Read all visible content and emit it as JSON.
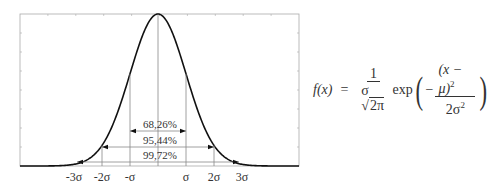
{
  "diagram": {
    "frame": {
      "x0": 20,
      "x1": 299,
      "y0": 14,
      "y1": 166
    },
    "mean_px": 158,
    "sigma_px": 28,
    "x_tick_labels": [
      "-3σ",
      "-2σ",
      "-σ",
      "σ",
      "2σ",
      "3σ"
    ],
    "intervals": [
      {
        "label": "68,26%",
        "k": 1,
        "y": 131
      },
      {
        "label": "95,44%",
        "k": 2,
        "y": 147
      },
      {
        "label": "99,72%",
        "k": 3,
        "y": 162
      }
    ],
    "colors": {
      "curve": "#111111",
      "frame": "#aaaaaa",
      "lines": "#888888",
      "text": "#333333"
    }
  },
  "formula": {
    "lhs": "f(x)",
    "equals": "=",
    "coef_num": "1",
    "coef_den_sigma": "σ",
    "coef_den_root": "2π",
    "exp": "exp",
    "neg": "−",
    "exp_num": "(x − μ)",
    "exp_num_pow": "2",
    "exp_den": "2σ",
    "exp_den_pow": "2"
  }
}
